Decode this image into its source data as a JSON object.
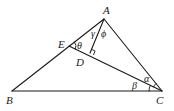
{
  "diagram": {
    "type": "geometry",
    "points": {
      "A": {
        "label": "A",
        "x": 104,
        "y": 19
      },
      "B": {
        "label": "B",
        "x": 12,
        "y": 91
      },
      "C": {
        "label": "C",
        "x": 162,
        "y": 91
      },
      "D": {
        "label": "D",
        "x": 90,
        "y": 53
      },
      "E": {
        "label": "E",
        "x": 69,
        "y": 46
      }
    },
    "segments": [
      "AB",
      "BC",
      "CA",
      "EC",
      "AD"
    ],
    "right_angle_at": "D",
    "angles": {
      "gamma": {
        "symbol": "γ",
        "at": "A",
        "between": "AE-AD"
      },
      "phi": {
        "symbol": "ϕ",
        "at": "A",
        "between": "AD-AC"
      },
      "theta": {
        "symbol": "θ",
        "at": "E",
        "between": "EA-ED"
      },
      "beta": {
        "symbol": "β",
        "at": "C",
        "between": "CB-CE"
      },
      "alpha": {
        "symbol": "α",
        "at": "C",
        "between": "CE-CA"
      }
    },
    "stroke_color": "#1a1a1a"
  }
}
